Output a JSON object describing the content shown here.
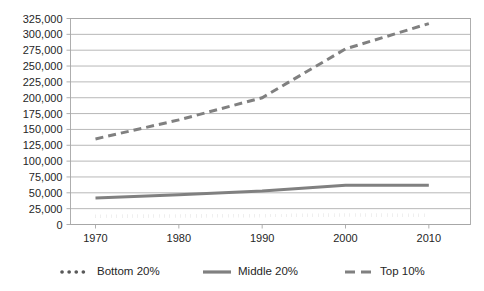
{
  "chart_data": {
    "type": "line",
    "title": "",
    "xlabel": "",
    "ylabel": "",
    "x": [
      1970,
      1980,
      1990,
      2000,
      2010
    ],
    "xlim": [
      1967,
      2015
    ],
    "ylim": [
      0,
      325000
    ],
    "grid": true,
    "legend_position": "bottom",
    "xtick_labels": [
      "1970",
      "1980",
      "1990",
      "2000",
      "2010"
    ],
    "ytick_labels": [
      "0",
      "25,000",
      "50,000",
      "75,000",
      "100,000",
      "125,000",
      "150,000",
      "175,000",
      "200,000",
      "225,000",
      "250,000",
      "275,000",
      "300,000",
      "325,000"
    ],
    "ytick_values": [
      0,
      25000,
      50000,
      75000,
      100000,
      125000,
      150000,
      175000,
      200000,
      225000,
      250000,
      275000,
      300000,
      325000
    ],
    "series": [
      {
        "name": "Bottom 20%",
        "style": "dotted",
        "color": "#595959",
        "x": [
          1970,
          1980,
          1990,
          2000,
          2010
        ],
        "values": [
          13000,
          13500,
          14000,
          15000,
          14500
        ]
      },
      {
        "name": "Middle 20%",
        "style": "solid",
        "color": "#808080",
        "x": [
          1970,
          1980,
          1990,
          2000,
          2010
        ],
        "values": [
          42000,
          47000,
          53000,
          62000,
          62000
        ]
      },
      {
        "name": "Top 10%",
        "style": "dashed",
        "color": "#808080",
        "x": [
          1970,
          1980,
          1990,
          2000,
          2010
        ],
        "values": [
          135000,
          165000,
          200000,
          277000,
          317000
        ]
      }
    ]
  },
  "legend": {
    "items": [
      {
        "label": "Bottom 20%",
        "marker": "dotted-line-marker"
      },
      {
        "label": "Middle 20%",
        "marker": "solid-line-marker"
      },
      {
        "label": "Top 10%",
        "marker": "dashed-line-marker"
      }
    ]
  },
  "colors": {
    "grid": "#a6a6a6",
    "axis": "#a6a6a6",
    "text": "#262626",
    "background": "#ffffff"
  }
}
